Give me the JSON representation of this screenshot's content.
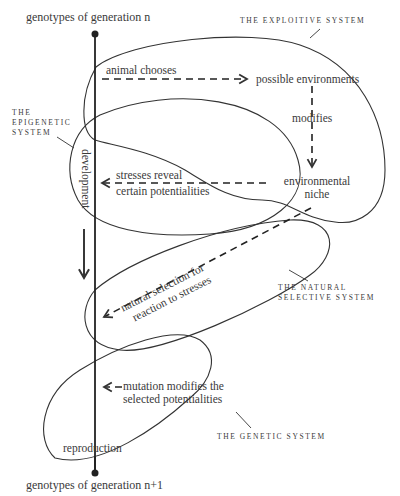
{
  "diagram": {
    "type": "flow-cycle",
    "top_node": {
      "label": "genotypes of generation n"
    },
    "bottom_node": {
      "label": "genotypes of generation n+1"
    },
    "systems": [
      {
        "id": "exploitive",
        "label": "THE EXPLOITIVE SYSTEM"
      },
      {
        "id": "epigenetic",
        "label_line1": "THE",
        "label_line2": "EPIGENETIC",
        "label_line3": "SYSTEM"
      },
      {
        "id": "natural",
        "label_line1": "THE NATURAL",
        "label_line2": "SELECTIVE SYSTEM"
      },
      {
        "id": "genetic",
        "label": "THE GENETIC SYSTEM"
      }
    ],
    "process_labels": {
      "animal_chooses": "animal chooses",
      "possible_environments": "possible environments",
      "modifies": "modifies",
      "environmental": "environmental",
      "niche": "niche",
      "stresses_line1": "stresses reveal",
      "stresses_line2": "certain potentialities",
      "development": "development",
      "ns_line1": "natural selection for",
      "ns_line2": "reaction to stresses",
      "mutation_line1": "mutation modifies the",
      "mutation_line2": "selected potentialities",
      "reproduction": "reproduction"
    },
    "edges": [
      {
        "from": "genotypes of generation n",
        "to": "possible environments",
        "label": "animal chooses",
        "style": "dashed"
      },
      {
        "from": "possible environments",
        "to": "environmental niche",
        "label": "modifies",
        "style": "dashed"
      },
      {
        "from": "environmental niche",
        "to": "development line",
        "label": "stresses reveal certain potentialities",
        "style": "dashed"
      },
      {
        "from": "environmental niche",
        "to": "development line",
        "label": "natural selection for reaction to stresses",
        "style": "dashed"
      },
      {
        "from": "mutation",
        "to": "development line",
        "label": "mutation modifies the selected potentialities",
        "style": "dashed"
      },
      {
        "from": "genotypes of generation n",
        "to": "genotypes of generation n+1",
        "label": "development / reproduction",
        "style": "solid"
      }
    ],
    "colors": {
      "ink": "#333333",
      "background": "#ffffff"
    }
  }
}
